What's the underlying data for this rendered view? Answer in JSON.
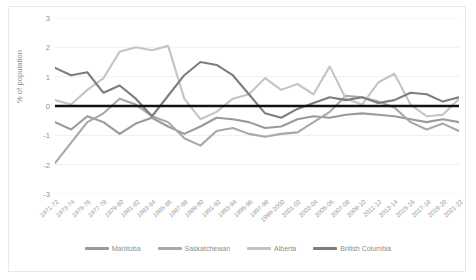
{
  "chart_data": {
    "type": "line",
    "title": "",
    "xlabel": "",
    "ylabel": "% of population",
    "ylim": [
      -3,
      3
    ],
    "yticks": [
      3,
      2,
      1,
      0,
      -1,
      -2,
      -3
    ],
    "grid": true,
    "legend_position": "bottom",
    "zero_reference_line": true,
    "categories": [
      "1971-72",
      "1973-74",
      "1975-76",
      "1977-78",
      "1979-80",
      "1981-82",
      "1983-84",
      "1985-86",
      "1987-88",
      "1989-90",
      "1991-92",
      "1993-94",
      "1995-96",
      "1997-98",
      "1999-2000",
      "2001-02",
      "2003-04",
      "2005-06",
      "2007-08",
      "2009-10",
      "2011-12",
      "2013-14",
      "2015-16",
      "2017-18",
      "2019-20",
      "2021-22"
    ],
    "series": [
      {
        "name": "Manitoba",
        "color": "#9a9a9a",
        "values": [
          -0.55,
          -0.8,
          -0.35,
          -0.55,
          -0.95,
          -0.6,
          -0.4,
          -0.7,
          -0.95,
          -0.7,
          -0.4,
          -0.45,
          -0.55,
          -0.75,
          -0.7,
          -0.45,
          -0.35,
          -0.4,
          -0.3,
          -0.25,
          -0.3,
          -0.35,
          -0.45,
          -0.55,
          -0.45,
          -0.55
        ]
      },
      {
        "name": "Saskatchewan",
        "color": "#a8a8a8",
        "values": [
          -1.95,
          -1.25,
          -0.55,
          -0.25,
          0.25,
          0.05,
          -0.35,
          -0.55,
          -1.1,
          -1.35,
          -0.85,
          -0.75,
          -0.95,
          -1.05,
          -0.95,
          -0.9,
          -0.55,
          -0.2,
          0.35,
          0.3,
          0.15,
          -0.05,
          -0.55,
          -0.8,
          -0.6,
          -0.85
        ]
      },
      {
        "name": "Alberta",
        "color": "#c4c4c4",
        "values": [
          0.2,
          0.05,
          0.55,
          0.95,
          1.85,
          2.0,
          1.9,
          2.05,
          0.25,
          -0.45,
          -0.2,
          0.25,
          0.4,
          0.95,
          0.55,
          0.75,
          0.4,
          1.35,
          0.25,
          0.05,
          0.8,
          1.1,
          0.05,
          -0.35,
          -0.3,
          0.25
        ]
      },
      {
        "name": "British Columbia",
        "color": "#7d7d7d",
        "values": [
          1.3,
          1.05,
          1.15,
          0.45,
          0.7,
          0.25,
          -0.35,
          0.35,
          1.05,
          1.5,
          1.4,
          1.05,
          0.4,
          -0.25,
          -0.4,
          -0.1,
          0.1,
          0.3,
          0.2,
          0.3,
          0.1,
          0.2,
          0.45,
          0.4,
          0.15,
          0.3
        ]
      }
    ]
  },
  "axis": {
    "y_title": "% of population"
  }
}
